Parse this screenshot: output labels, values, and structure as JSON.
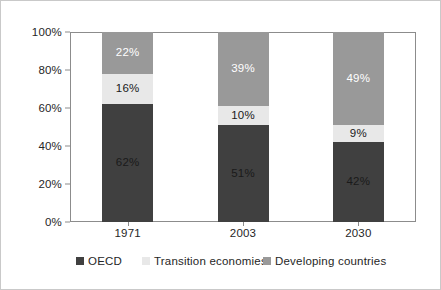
{
  "chart_data": {
    "type": "bar",
    "subtype": "stacked-100-percent",
    "title": "",
    "xlabel": "",
    "ylabel": "",
    "categories": [
      "1971",
      "2003",
      "2030"
    ],
    "series": [
      {
        "name": "OECD",
        "values": [
          62,
          51,
          42
        ],
        "color": "#404040",
        "label_color": "#1a1a1a"
      },
      {
        "name": "Transition economies",
        "values": [
          16,
          10,
          9
        ],
        "color": "#e8e8e8",
        "label_color": "#1a1a1a"
      },
      {
        "name": "Developing countries",
        "values": [
          22,
          39,
          49
        ],
        "color": "#999999",
        "label_color": "#ffffff"
      }
    ],
    "stack_order_bottom_to_top": [
      "OECD",
      "Transition economies",
      "Developing countries"
    ],
    "data_labels": {
      "1971": {
        "OECD": "62%",
        "Transition economies": "16%",
        "Developing countries": "22%"
      },
      "2003": {
        "OECD": "51%",
        "Transition economies": "10%",
        "Developing countries": "39%"
      },
      "2030": {
        "OECD": "42%",
        "Transition economies": "9%",
        "Developing countries": "49%"
      }
    },
    "ylim": [
      0,
      100
    ],
    "y_ticks": [
      0,
      20,
      40,
      60,
      80,
      100
    ],
    "y_tick_labels": [
      "0%",
      "20%",
      "40%",
      "60%",
      "80%",
      "100%"
    ],
    "grid": false,
    "legend_position": "bottom"
  },
  "axes": {
    "y": {
      "ticks": [
        {
          "value": 100,
          "label": "100%"
        },
        {
          "value": 80,
          "label": "80%"
        },
        {
          "value": 60,
          "label": "60%"
        },
        {
          "value": 40,
          "label": "40%"
        },
        {
          "value": 20,
          "label": "20%"
        },
        {
          "value": 0,
          "label": "0%"
        }
      ]
    },
    "x": {
      "ticks": [
        {
          "label": "1971"
        },
        {
          "label": "2003"
        },
        {
          "label": "2030"
        }
      ]
    }
  },
  "bars": [
    {
      "category": "1971",
      "segments": [
        {
          "series": "Developing countries",
          "value": 22,
          "label": "22%",
          "color": "#999999",
          "label_tone": "light"
        },
        {
          "series": "Transition economies",
          "value": 16,
          "label": "16%",
          "color": "#e8e8e8",
          "label_tone": "dark"
        },
        {
          "series": "OECD",
          "value": 62,
          "label": "62%",
          "color": "#404040",
          "label_tone": "dark"
        }
      ]
    },
    {
      "category": "2003",
      "segments": [
        {
          "series": "Developing countries",
          "value": 39,
          "label": "39%",
          "color": "#999999",
          "label_tone": "light"
        },
        {
          "series": "Transition economies",
          "value": 10,
          "label": "10%",
          "color": "#e8e8e8",
          "label_tone": "dark"
        },
        {
          "series": "OECD",
          "value": 51,
          "label": "51%",
          "color": "#404040",
          "label_tone": "dark"
        }
      ]
    },
    {
      "category": "2030",
      "segments": [
        {
          "series": "Developing countries",
          "value": 49,
          "label": "49%",
          "color": "#999999",
          "label_tone": "light"
        },
        {
          "series": "Transition economies",
          "value": 9,
          "label": "9%",
          "color": "#e8e8e8",
          "label_tone": "dark"
        },
        {
          "series": "OECD",
          "value": 42,
          "label": "42%",
          "color": "#404040",
          "label_tone": "dark"
        }
      ]
    }
  ],
  "legend": {
    "items": [
      {
        "label": "OECD",
        "color": "#404040"
      },
      {
        "label": "Transition economies",
        "color": "#e8e8e8"
      },
      {
        "label": "Developing countries",
        "color": "#999999"
      }
    ]
  },
  "colors": {
    "oecd": "#404040",
    "transition_economies": "#e8e8e8",
    "developing_countries": "#999999",
    "axis": "#8c8c8c",
    "text": "#262626",
    "background": "#ffffff",
    "outer_border": "#c9c9c9"
  }
}
